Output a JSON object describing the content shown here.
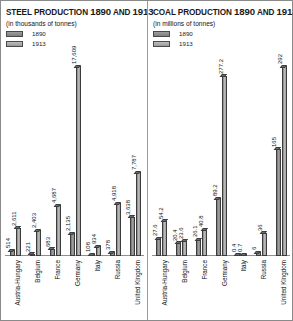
{
  "panels": {
    "steel": {
      "title_lead": "Steel production",
      "title_years": "1890",
      "title_and": "and",
      "title_years2": "1913",
      "subtitle": "(in thousands of tonnes)",
      "legend": [
        {
          "label": "1890",
          "color": "#8a8a8a"
        },
        {
          "label": "1913",
          "color": "#b0b0b0"
        }
      ]
    },
    "coal": {
      "title_lead": "Coal production",
      "title_years": "1890",
      "title_and": "and",
      "title_years2": "1913",
      "subtitle": "(in millions of tonnes)",
      "legend": [
        {
          "label": "1890",
          "color": "#8a8a8a"
        },
        {
          "label": "1913",
          "color": "#b0b0b0"
        }
      ]
    }
  },
  "chart_data": [
    {
      "type": "bar",
      "title": "Steel production 1890 and 1913",
      "ylabel": "thousands of tonnes",
      "xlabel": "",
      "categories": [
        "Austria-Hungary",
        "Belgium",
        "France",
        "Germany",
        "Italy",
        "Russia",
        "United Kingdom"
      ],
      "series": [
        {
          "name": "1890",
          "values": [
            514,
            221,
            683,
            2135,
            108,
            378,
            3638
          ]
        },
        {
          "name": "1913",
          "values": [
            2611,
            2403,
            4687,
            17609,
            934,
            4918,
            7787
          ]
        }
      ],
      "labels_1890": [
        "514",
        "221",
        "683",
        "2,135",
        "108",
        "378",
        "3,638"
      ],
      "labels_1913": [
        "2,611",
        "2,403",
        "4,687",
        "17,609",
        "934",
        "4,918",
        "7,787"
      ],
      "ylim": [
        0,
        17609
      ],
      "grid": false,
      "legend_position": "top-left"
    },
    {
      "type": "bar",
      "title": "Coal production 1890 and 1913",
      "ylabel": "millions of tonnes",
      "xlabel": "",
      "categories": [
        "Austria-Hungary",
        "Belgium",
        "France",
        "Germany",
        "Italy",
        "Russia",
        "United Kingdom"
      ],
      "series": [
        {
          "name": "1890",
          "values": [
            27.6,
            20.4,
            26.1,
            89.2,
            0.4,
            6.0,
            165.0
          ]
        },
        {
          "name": "1913",
          "values": [
            54.2,
            23.6,
            40.8,
            277.2,
            0.7,
            36.0,
            292.0
          ]
        }
      ],
      "labels_1890": [
        "27.6",
        "20.4",
        "26.1",
        "89.2",
        "0.4",
        "6",
        "165"
      ],
      "labels_1913": [
        "54.2",
        "23.6",
        "40.8",
        "277.2",
        "0.7",
        "36",
        "292"
      ],
      "ylim": [
        0,
        292
      ],
      "grid": false,
      "legend_position": "top-left"
    }
  ]
}
